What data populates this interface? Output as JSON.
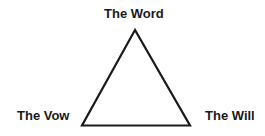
{
  "diagram": {
    "type": "triangle",
    "vertices": {
      "top": "The Word",
      "bottom_left": "The Vow",
      "bottom_right": "The Will"
    },
    "stroke_color": "#1a1a1a",
    "background": "#ffffff"
  }
}
